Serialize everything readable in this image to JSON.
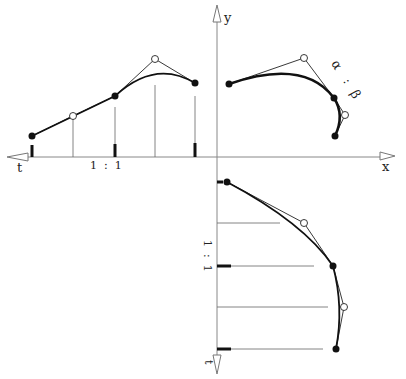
{
  "diagram": {
    "colors": {
      "ink": "#1a1a1a",
      "thin": "#555555",
      "axis": "#888888",
      "background": "#ffffff"
    },
    "labels": {
      "y_axis": "y",
      "x_axis": "x",
      "t_left": "t",
      "t_bottom": "t",
      "ratio_horizontal": "1  :  1",
      "ratio_vertical": "1  :  1",
      "alpha": "α",
      "colon": ":",
      "beta": "β"
    },
    "panels": {
      "left_tx": {
        "filled_points": [
          [
            32,
            136
          ],
          [
            115,
            96
          ],
          [
            195,
            83
          ]
        ],
        "open_points": [
          [
            73,
            116
          ],
          [
            155,
            59
          ]
        ],
        "ticks_bold_x": [
          32,
          115,
          195
        ],
        "guides_thin_x": [
          73,
          155
        ]
      },
      "top_right_xy": {
        "filled_points": [
          [
            229,
            84
          ],
          [
            334,
            98
          ],
          [
            335,
            136
          ]
        ],
        "open_points": [
          [
            304,
            58
          ],
          [
            345,
            115
          ]
        ]
      },
      "bottom_right_yt": {
        "filled_points": [
          [
            227,
            182
          ],
          [
            333,
            266
          ],
          [
            336,
            349
          ]
        ],
        "open_points": [
          [
            304,
            223
          ],
          [
            344,
            307
          ]
        ],
        "ticks_bold_y": [
          182,
          266,
          349
        ],
        "guides_thin_y": [
          223,
          307
        ]
      }
    }
  }
}
